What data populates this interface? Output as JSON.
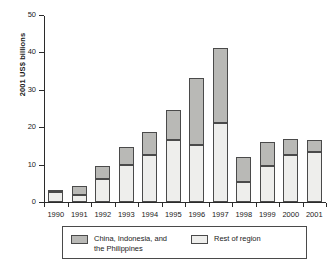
{
  "chart_data": {
    "type": "bar",
    "subtype": "stacked-vertical",
    "title": "",
    "xlabel": "",
    "ylabel": "2001 US$ billions",
    "ylim": [
      0,
      50
    ],
    "yticks": [
      0,
      10,
      20,
      30,
      40,
      50
    ],
    "ytick_labels": [
      "0",
      "10",
      "20",
      "30",
      "40",
      "50"
    ],
    "grid": false,
    "legend_position": "bottom",
    "categories": [
      "1990",
      "1991",
      "1992",
      "1993",
      "1994",
      "1995",
      "1996",
      "1997",
      "1998",
      "1999",
      "2000",
      "2001"
    ],
    "series": [
      {
        "name": "Rest of region",
        "color": "#eeeeec",
        "values": [
          2.6,
          2.0,
          6.2,
          10.0,
          12.5,
          16.6,
          15.3,
          21.2,
          5.4,
          9.6,
          12.5,
          13.3
        ]
      },
      {
        "name": "China, Indonesia, and the Philippines",
        "color": "#b9b9b6",
        "values": [
          0.5,
          2.2,
          3.5,
          4.7,
          6.2,
          8.0,
          17.9,
          19.9,
          6.6,
          6.4,
          4.4,
          3.4
        ]
      }
    ],
    "totals": [
      3.1,
      4.2,
      9.7,
      14.7,
      18.7,
      24.6,
      33.2,
      41.1,
      12.0,
      16.0,
      16.9,
      16.7
    ]
  },
  "axis": {
    "y_label": "2001 US$ billions"
  },
  "legend": {
    "entries": [
      {
        "label": "China, Indonesia, and\nthe Philippines",
        "swatch": "dark-gray-swatch"
      },
      {
        "label": "Rest of region",
        "swatch": "light-gray-swatch"
      }
    ]
  }
}
